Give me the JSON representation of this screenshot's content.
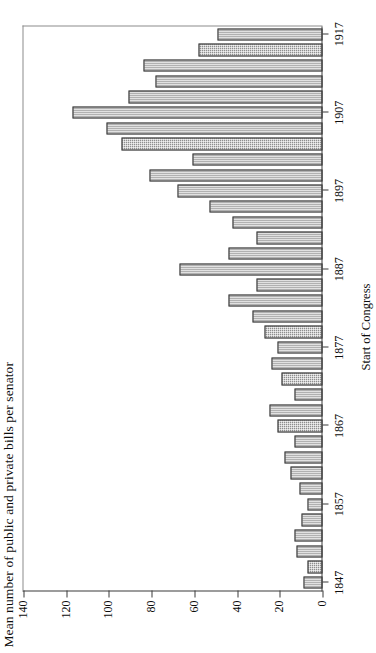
{
  "chart_data": {
    "type": "bar",
    "title": "",
    "ylabel": "Mean number of public and private bills per senator",
    "xlabel": "Start of Congress",
    "ylim": [
      0,
      140
    ],
    "yticks": [
      0,
      20,
      40,
      60,
      80,
      100,
      120,
      140
    ],
    "ytick_labels": [
      "0",
      "20",
      "40",
      "60",
      "80",
      "100",
      "120",
      "140"
    ],
    "xticks": [
      1847,
      1857,
      1867,
      1877,
      1887,
      1897,
      1907,
      1917
    ],
    "xtick_labels": [
      "1847",
      "1857",
      "1867",
      "1877",
      "1887",
      "1897",
      "1907",
      "1917"
    ],
    "grid": false,
    "legend": null,
    "orientation": "horizontal-bars-rotated",
    "bar_color": "#8e8e8e",
    "bar_edge_color": "#3f3f3f",
    "axis_color": "#3a3a3a",
    "categories": [
      1847,
      1849,
      1851,
      1853,
      1855,
      1857,
      1859,
      1861,
      1863,
      1865,
      1867,
      1869,
      1871,
      1873,
      1875,
      1877,
      1879,
      1881,
      1883,
      1885,
      1887,
      1889,
      1891,
      1893,
      1895,
      1897,
      1899,
      1901,
      1903,
      1905,
      1907,
      1909,
      1911,
      1913,
      1915,
      1917
    ],
    "values": [
      9,
      7,
      12,
      13,
      10,
      7,
      11,
      15,
      18,
      13,
      21,
      25,
      13,
      19,
      24,
      21,
      27,
      33,
      44,
      31,
      67,
      44,
      31,
      42,
      53,
      68,
      81,
      61,
      94,
      101,
      117,
      91,
      78,
      84,
      58,
      49
    ]
  }
}
